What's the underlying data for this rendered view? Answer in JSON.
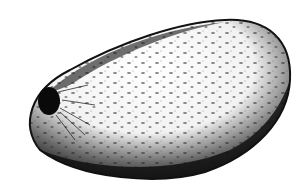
{
  "image": {
    "subject": "Engraved illustration of an oval seed with a dark hilum at the left end",
    "style": "black-and-white stipple engraving",
    "colors": {
      "background": "#ffffff",
      "ink": "#111111",
      "highlight": "#ffffff"
    }
  }
}
